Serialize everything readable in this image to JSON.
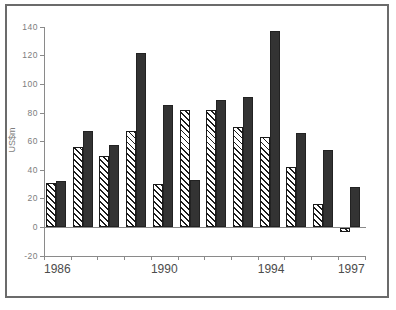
{
  "figure": {
    "background": "#ffffff",
    "border_color": "#6b6b6b"
  },
  "chart_data": {
    "type": "bar",
    "title": "",
    "xlabel": "",
    "ylabel": "US$m",
    "ylim": [
      -20,
      140
    ],
    "ytick_step": 20,
    "ytick_values": [
      140,
      120,
      100,
      80,
      60,
      40,
      20,
      0,
      -20
    ],
    "grid": false,
    "legend": "none",
    "categories": [
      "1986",
      "1987",
      "1988",
      "1989",
      "1990",
      "1991",
      "1992",
      "1993",
      "1994",
      "1995",
      "1996",
      "1997"
    ],
    "x_axis_shown_labels": [
      {
        "label": "1986",
        "slot": 0
      },
      {
        "label": "1990",
        "slot": 4
      },
      {
        "label": "1994",
        "slot": 8
      },
      {
        "label": "1997",
        "slot": 11
      }
    ],
    "series": [
      {
        "name": "hatched",
        "style": "diagonal-hatch",
        "fill": "#ffffff",
        "hatch_color": "#1c1c1c",
        "values": [
          31,
          56,
          50,
          67,
          30,
          82,
          82,
          70,
          63,
          42,
          16,
          -3
        ]
      },
      {
        "name": "solid",
        "style": "solid-dark",
        "fill": "#333333",
        "values": [
          32,
          67,
          57,
          122,
          85,
          33,
          89,
          91,
          137,
          66,
          54,
          28
        ]
      }
    ]
  }
}
